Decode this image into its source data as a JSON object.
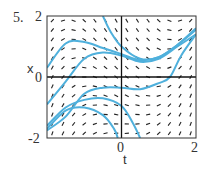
{
  "figure": {
    "number": "5."
  },
  "chart_data": {
    "type": "slope-field",
    "title": "",
    "xlabel": "t",
    "ylabel": "x",
    "xlim": [
      -2,
      2
    ],
    "ylim": [
      -2,
      2
    ],
    "x_ticks": [
      "0",
      "2"
    ],
    "y_ticks": [
      "2",
      "0",
      "-2"
    ],
    "x_tick_left": "",
    "grid": false,
    "solution_curve_color": "#4fb0dc",
    "solution_curves": [
      {
        "name": "curve-1",
        "points": [
          [
            -2,
            -1.7
          ],
          [
            -1.5,
            -1.1
          ],
          [
            -1,
            -1.0
          ],
          [
            -0.5,
            -1.25
          ],
          [
            -0.2,
            -1.7
          ],
          [
            -0.1,
            -2
          ]
        ]
      },
      {
        "name": "curve-2",
        "points": [
          [
            -2,
            -1.6
          ],
          [
            -1.5,
            -1.0
          ],
          [
            -1,
            -0.75
          ],
          [
            -0.5,
            -0.7
          ],
          [
            0,
            -0.95
          ],
          [
            0.3,
            -1.5
          ],
          [
            0.5,
            -2
          ]
        ]
      },
      {
        "name": "curve-3",
        "points": [
          [
            -2,
            -0.9
          ],
          [
            -1.5,
            -0.15
          ],
          [
            -1,
            0.6
          ],
          [
            -0.5,
            0.8
          ],
          [
            0,
            0.7
          ],
          [
            0.5,
            0.5
          ],
          [
            1,
            0.6
          ],
          [
            1.5,
            1.0
          ],
          [
            2,
            1.4
          ]
        ]
      },
      {
        "name": "curve-4",
        "points": [
          [
            -2,
            0.3
          ],
          [
            -1.5,
            1.1
          ],
          [
            -1,
            1.15
          ],
          [
            -0.5,
            0.95
          ],
          [
            0,
            0.75
          ],
          [
            0.5,
            0.55
          ],
          [
            1,
            0.65
          ],
          [
            1.5,
            1.05
          ],
          [
            2,
            1.6
          ]
        ]
      },
      {
        "name": "curve-5",
        "points": [
          [
            -0.5,
            2
          ],
          [
            -0.3,
            1.5
          ],
          [
            0,
            1.0
          ],
          [
            0.5,
            0.6
          ],
          [
            1,
            0.65
          ],
          [
            1.5,
            1.05
          ],
          [
            2,
            1.55
          ]
        ]
      },
      {
        "name": "curve-6",
        "points": [
          [
            -2,
            -1.75
          ],
          [
            -1.5,
            -1.3
          ],
          [
            -1,
            -0.55
          ],
          [
            -0.5,
            -0.35
          ],
          [
            0,
            -0.35
          ],
          [
            0.5,
            -0.4
          ],
          [
            1,
            -0.2
          ],
          [
            1.3,
            0
          ],
          [
            1.6,
            0.7
          ],
          [
            2,
            1.4
          ]
        ]
      }
    ]
  }
}
